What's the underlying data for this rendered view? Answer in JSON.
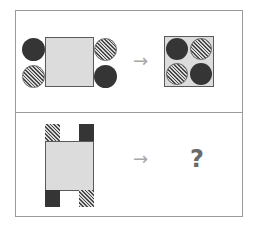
{
  "puzzle": {
    "row1": {
      "arrow": "→",
      "left_figure": {
        "shape": "square",
        "fill": "#dcdcdc",
        "circles": [
          {
            "position": "top-left-outside",
            "style": "dark"
          },
          {
            "position": "bottom-left-outside",
            "style": "hatched"
          },
          {
            "position": "top-right-outside",
            "style": "hatched"
          },
          {
            "position": "bottom-right-outside",
            "style": "dark"
          }
        ]
      },
      "right_figure": {
        "shape": "square",
        "fill": "#dcdcdc",
        "circles": [
          {
            "position": "top-left-inside",
            "style": "dark"
          },
          {
            "position": "top-right-inside",
            "style": "hatched"
          },
          {
            "position": "bottom-left-inside",
            "style": "hatched"
          },
          {
            "position": "bottom-right-inside",
            "style": "dark"
          }
        ]
      }
    },
    "row2": {
      "arrow": "→",
      "question_mark": "?",
      "left_figure": {
        "shape": "rectangle",
        "fill": "#dcdcdc",
        "tabs": [
          {
            "position": "top-left",
            "style": "hatched"
          },
          {
            "position": "top-right",
            "style": "dark"
          },
          {
            "position": "bottom-left",
            "style": "dark"
          },
          {
            "position": "bottom-right",
            "style": "hatched"
          }
        ]
      }
    }
  },
  "colors": {
    "dark": "#353535",
    "light_fill": "#dcdcdc",
    "border": "#9a9a9a",
    "arrow": "#a8a8a8"
  }
}
